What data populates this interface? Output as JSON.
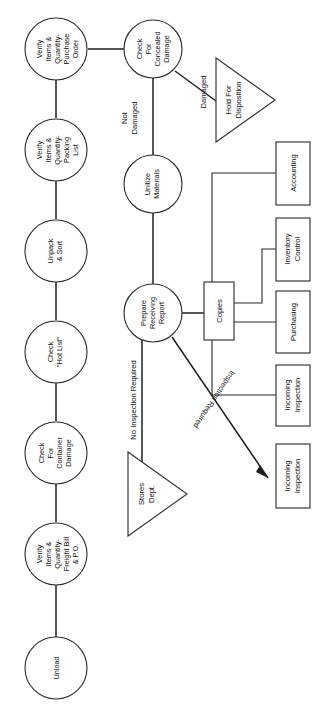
{
  "diagram": {
    "orientation": "rotated-90-ccw",
    "colors": {
      "line": "#1f1f1f",
      "shape_stroke": "#3a3a3a",
      "background": "#ffffff",
      "text": "#111111"
    },
    "nodes": [
      {
        "id": "unload",
        "shape": "circle",
        "lines": [
          "Unload"
        ]
      },
      {
        "id": "verify-freight",
        "shape": "circle",
        "lines": [
          "Verify",
          "Items &",
          "Quantity-",
          "Freight Bill",
          "& P.O."
        ]
      },
      {
        "id": "check-container",
        "shape": "circle",
        "lines": [
          "Check",
          "For",
          "Container",
          "Damage"
        ]
      },
      {
        "id": "check-hot-list",
        "shape": "circle",
        "lines": [
          "Check",
          "\"Hot List\""
        ]
      },
      {
        "id": "unpack-sort",
        "shape": "circle",
        "lines": [
          "Unpack",
          "& Sort"
        ]
      },
      {
        "id": "verify-packing",
        "shape": "circle",
        "lines": [
          "Verify",
          "Items &",
          "Quantity-",
          "Packing",
          "List"
        ]
      },
      {
        "id": "verify-po",
        "shape": "circle",
        "lines": [
          "Verify",
          "Items &",
          "Quantity-",
          "Purchase",
          "Order"
        ]
      },
      {
        "id": "check-concealed",
        "shape": "circle",
        "lines": [
          "Check",
          "For",
          "Concealed",
          "Damage"
        ]
      },
      {
        "id": "unitize",
        "shape": "circle",
        "lines": [
          "Unitize",
          "Materials"
        ]
      },
      {
        "id": "prepare-report",
        "shape": "circle",
        "lines": [
          "Prepare",
          "Receiving",
          "Report"
        ]
      },
      {
        "id": "hold-disposition",
        "shape": "triangle",
        "lines": [
          "Hold For",
          "Disposition"
        ]
      },
      {
        "id": "stores-dept",
        "shape": "triangle",
        "lines": [
          "Stores",
          "Dept."
        ]
      },
      {
        "id": "copies",
        "shape": "box",
        "lines": [
          "Copies"
        ]
      },
      {
        "id": "accounting",
        "shape": "box",
        "lines": [
          "Accounting"
        ]
      },
      {
        "id": "inventory-control",
        "shape": "box",
        "lines": [
          "Inventory",
          "Control"
        ]
      },
      {
        "id": "purchasing",
        "shape": "box",
        "lines": [
          "Purchasing"
        ]
      },
      {
        "id": "incoming-inspection-copy",
        "shape": "box",
        "lines": [
          "Incoming",
          "Inspection"
        ]
      },
      {
        "id": "incoming-inspection-route",
        "shape": "box",
        "lines": [
          "Incoming",
          "Inspection"
        ]
      }
    ],
    "edge_labels": [
      {
        "id": "not-damaged",
        "text": "Not Damaged",
        "lines": [
          "Not",
          "Damaged"
        ]
      },
      {
        "id": "damaged",
        "text": "Damaged",
        "lines": [
          "Damaged"
        ]
      },
      {
        "id": "no-inspection-required",
        "text": "No Inspection Required",
        "lines": [
          "No Inspection Required"
        ]
      },
      {
        "id": "inspection-required",
        "text": "Inspection Required",
        "lines": [
          "Inspection Required"
        ]
      }
    ],
    "labels": {
      "unload": "Unload",
      "verify_freight_1": "Verify",
      "verify_freight_2": "Items &",
      "verify_freight_3": "Quantity-",
      "verify_freight_4": "Freight Bill",
      "verify_freight_5": "& P.O.",
      "check_container_1": "Check",
      "check_container_2": "For",
      "check_container_3": "Container",
      "check_container_4": "Damage",
      "check_hot_1": "Check",
      "check_hot_2": "\"Hot List\"",
      "unpack_1": "Unpack",
      "unpack_2": "& Sort",
      "verify_packing_1": "Verify",
      "verify_packing_2": "Items &",
      "verify_packing_3": "Quantity-",
      "verify_packing_4": "Packing",
      "verify_packing_5": "List",
      "verify_po_1": "Verify",
      "verify_po_2": "Items &",
      "verify_po_3": "Quantity-",
      "verify_po_4": "Purchase",
      "verify_po_5": "Order",
      "concealed_1": "Check",
      "concealed_2": "For",
      "concealed_3": "Concealed",
      "concealed_4": "Damage",
      "unitize_1": "Unitize",
      "unitize_2": "Materials",
      "prepare_1": "Prepare",
      "prepare_2": "Receiving",
      "prepare_3": "Report",
      "hold_1": "Hold For",
      "hold_2": "Disposition",
      "stores_1": "Stores",
      "stores_2": "Dept.",
      "copies": "Copies",
      "accounting": "Accounting",
      "inventory_1": "Inventory",
      "inventory_2": "Control",
      "purchasing": "Purchasing",
      "incoming_a_1": "Incoming",
      "incoming_a_2": "Inspection",
      "incoming_b_1": "Incoming",
      "incoming_b_2": "Inspection",
      "edge_not": "Not",
      "edge_damaged_word": "Damaged",
      "edge_damaged": "Damaged",
      "edge_no_inspection": "No Inspection Required",
      "edge_inspection": "Inspection Required"
    }
  }
}
